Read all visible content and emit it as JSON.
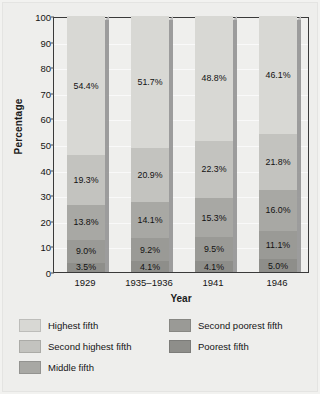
{
  "chart_data": {
    "type": "bar",
    "subtype": "100% stacked bar",
    "title": "",
    "subtitle": "",
    "xlabel": "Year",
    "ylabel": "Percentage",
    "categories": [
      "1929",
      "1935–1936",
      "1941",
      "1946"
    ],
    "ylim": [
      0,
      100
    ],
    "ytick_labels": [
      "0",
      "10",
      "20",
      "30",
      "40",
      "50",
      "60",
      "70",
      "80",
      "90",
      "100"
    ],
    "ytick_values": [
      0,
      10,
      20,
      30,
      40,
      50,
      60,
      70,
      80,
      90,
      100
    ],
    "grid": true,
    "legend_position": "bottom",
    "stack_order_bottom_to_top": [
      "Poorest fifth",
      "Second poorest fifth",
      "Middle fifth",
      "Second highest fifth",
      "Highest fifth"
    ],
    "series": [
      {
        "name": "Highest fifth",
        "color": "#d8d8d4",
        "values": [
          54.4,
          51.7,
          48.8,
          46.1
        ],
        "labels": [
          "54.4%",
          "51.7%",
          "48.8%",
          "46.1%"
        ]
      },
      {
        "name": "Second highest fifth",
        "color": "#c3c3bf",
        "values": [
          19.3,
          20.9,
          22.3,
          21.8
        ],
        "labels": [
          "19.3%",
          "20.9%",
          "22.3%",
          "21.8%"
        ]
      },
      {
        "name": "Middle fifth",
        "color": "#a8a8a4",
        "values": [
          13.8,
          14.1,
          15.3,
          16.0
        ],
        "labels": [
          "13.8%",
          "14.1%",
          "15.3%",
          "16.0%"
        ]
      },
      {
        "name": "Second poorest fifth",
        "color": "#9a9a96",
        "values": [
          9.0,
          9.2,
          9.5,
          11.1
        ],
        "labels": [
          "9.0%",
          "9.2%",
          "9.5%",
          "11.1%"
        ]
      },
      {
        "name": "Poorest fifth",
        "color": "#8e8e8a",
        "values": [
          3.5,
          4.1,
          4.1,
          5.0
        ],
        "labels": [
          "3.5%",
          "4.1%",
          "4.1%",
          "5.0%"
        ]
      }
    ]
  },
  "legend": {
    "entries": [
      {
        "label": "Highest fifth",
        "color": "#d8d8d4"
      },
      {
        "label": "Second poorest fifth",
        "color": "#9a9a96"
      },
      {
        "label": "Second highest fifth",
        "color": "#c3c3bf"
      },
      {
        "label": "Poorest fifth",
        "color": "#8e8e8a"
      },
      {
        "label": "Middle fifth",
        "color": "#a8a8a4"
      }
    ]
  }
}
